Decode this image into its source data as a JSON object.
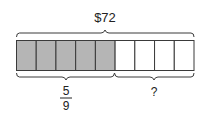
{
  "diagram": {
    "total_label": "$72",
    "fraction": {
      "numerator": "5",
      "denominator": "9"
    },
    "unknown_label": "?",
    "total_parts": 9,
    "shaded_parts": 5,
    "colors": {
      "shaded": "#b5b5b5",
      "unshaded": "#ffffff",
      "stroke": "#3a3a3a"
    }
  }
}
